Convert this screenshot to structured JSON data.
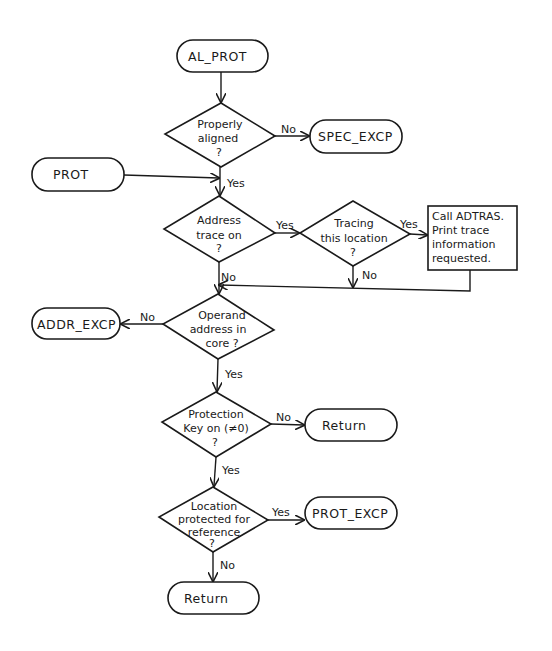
{
  "diagram": {
    "type": "flowchart",
    "style": "hand-drawn",
    "terminals": {
      "al_prot": "AL_PROT",
      "spec_excp": "SPEC_EXCP",
      "prot": "PROT",
      "addr_excp": "ADDR_EXCP",
      "return_1": "Return",
      "prot_excp": "PROT_EXCP",
      "return_2": "Return"
    },
    "decisions": {
      "aligned": [
        "Properly",
        "aligned",
        "?"
      ],
      "trace_on": [
        "Address",
        "trace on",
        "?"
      ],
      "tracing_loc": [
        "Tracing",
        "this location",
        "?"
      ],
      "in_core": [
        "Operand",
        "address in",
        "core ?"
      ],
      "key_on": [
        "Protection",
        "Key on (≠0)",
        "?"
      ],
      "protected": [
        "Location",
        "protected for",
        "reference",
        "?"
      ]
    },
    "process": {
      "adtras": [
        "Call ADTRAS.",
        "Print trace",
        "information",
        "requested."
      ]
    },
    "edge_labels": {
      "aligned_no": "No",
      "aligned_yes": "Yes",
      "trace_on_yes": "Yes",
      "trace_on_no": "No",
      "tracing_loc_yes": "Yes",
      "tracing_loc_no": "No",
      "in_core_no": "No",
      "in_core_yes": "Yes",
      "key_on_no": "No",
      "key_on_yes": "Yes",
      "protected_yes": "Yes",
      "protected_no": "No"
    },
    "edges": [
      {
        "from": "AL_PROT",
        "to": "Properly aligned?"
      },
      {
        "from": "Properly aligned?",
        "to": "SPEC_EXCP",
        "label": "No"
      },
      {
        "from": "Properly aligned?",
        "to": "Address trace on?",
        "label": "Yes"
      },
      {
        "from": "PROT",
        "to": "Address trace on?"
      },
      {
        "from": "Address trace on?",
        "to": "Tracing this location?",
        "label": "Yes"
      },
      {
        "from": "Address trace on?",
        "to": "Operand address in core?",
        "label": "No"
      },
      {
        "from": "Tracing this location?",
        "to": "Call ADTRAS. Print trace information requested.",
        "label": "Yes"
      },
      {
        "from": "Tracing this location?",
        "to": "Operand address in core?",
        "label": "No"
      },
      {
        "from": "Call ADTRAS. Print trace information requested.",
        "to": "Operand address in core?"
      },
      {
        "from": "Operand address in core?",
        "to": "ADDR_EXCP",
        "label": "No"
      },
      {
        "from": "Operand address in core?",
        "to": "Protection Key on (≠0)?",
        "label": "Yes"
      },
      {
        "from": "Protection Key on (≠0)?",
        "to": "Return",
        "label": "No"
      },
      {
        "from": "Protection Key on (≠0)?",
        "to": "Location protected for reference?",
        "label": "Yes"
      },
      {
        "from": "Location protected for reference?",
        "to": "PROT_EXCP",
        "label": "Yes"
      },
      {
        "from": "Location protected for reference?",
        "to": "Return",
        "label": "No"
      }
    ]
  }
}
